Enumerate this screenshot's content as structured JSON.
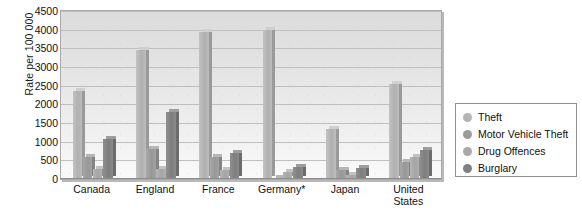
{
  "chart_data": {
    "type": "bar",
    "title": "",
    "subtitle": "",
    "xlabel": "",
    "ylabel": "Rate per 100 000",
    "ylim": [
      0,
      4500
    ],
    "ytick_step": 500,
    "yticks": [
      "4500",
      "4000",
      "3500",
      "3000",
      "2500",
      "2000",
      "1500",
      "1000",
      "500",
      "0"
    ],
    "grid": true,
    "legend_position": "right",
    "categories": [
      "Canada",
      "England",
      "France",
      "Germany*",
      "Japan",
      "United\nStates"
    ],
    "series": [
      {
        "name": "Theft",
        "color": "#b5b5b5",
        "values": [
          2350,
          3450,
          3950,
          4000,
          1350,
          2550
        ]
      },
      {
        "name": "Motor Vehicle Theft",
        "color": "#9b9b9b",
        "values": [
          600,
          800,
          580,
          40,
          250,
          450
        ]
      },
      {
        "name": "Drug Offences",
        "color": "#a9a9a9",
        "values": [
          270,
          280,
          250,
          200,
          110,
          600
        ]
      },
      {
        "name": "Burglary",
        "color": "#808080",
        "values": [
          1080,
          1800,
          690,
          330,
          300,
          770
        ]
      }
    ]
  },
  "axis": {
    "y_title": "Rate per 100 000"
  },
  "legend": {
    "items": [
      {
        "label": "Theft"
      },
      {
        "label": "Motor Vehicle Theft"
      },
      {
        "label": "Drug Offences"
      },
      {
        "label": "Burglary"
      }
    ]
  }
}
